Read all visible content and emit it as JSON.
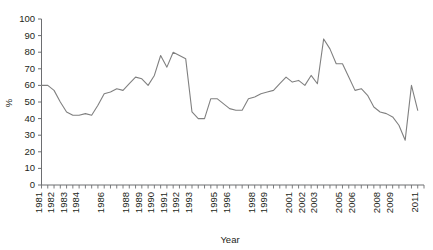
{
  "chart_data": {
    "type": "line",
    "title": "",
    "xlabel": "Year",
    "ylabel": "%",
    "xlim": [
      1981,
      2011.5
    ],
    "ylim": [
      0,
      100
    ],
    "grid": false,
    "legend": null,
    "line_color": "#808080",
    "axis_color": "#6d6e71",
    "background": "#ffffff",
    "ytick_values": [
      0,
      10,
      20,
      30,
      40,
      50,
      60,
      70,
      80,
      90,
      100
    ],
    "ytick_labels": [
      "0",
      "10",
      "20",
      "30",
      "40",
      "50",
      "60",
      "70",
      "80",
      "90",
      "100"
    ],
    "xtick_labels": [
      "1981",
      "1982",
      "1983",
      "1984",
      "1986",
      "1988",
      "1989",
      "1990",
      "1991",
      "1992",
      "1993",
      "1995",
      "1996",
      "1998",
      "1999",
      "2001",
      "2002",
      "2003",
      "2005",
      "2006",
      "2008",
      "2009",
      "2011"
    ],
    "xtick_label_positions": [
      1981,
      1982,
      1983,
      1984,
      1986,
      1988,
      1989,
      1990,
      1991,
      1992,
      1993,
      1995,
      1996,
      1998,
      1999,
      2001,
      2002,
      2003,
      2005,
      2006,
      2008,
      2009,
      2011
    ],
    "x_tick_interval": 0.5,
    "series": [
      {
        "name": "percent",
        "x": [
          1981.0,
          1981.5,
          1982.0,
          1982.5,
          1983.0,
          1983.5,
          1984.0,
          1984.5,
          1985.0,
          1985.5,
          1986.0,
          1986.5,
          1987.0,
          1987.5,
          1988.0,
          1988.5,
          1989.0,
          1989.5,
          1990.0,
          1990.5,
          1991.0,
          1991.5,
          1992.0,
          1992.5,
          1993.0,
          1993.5,
          1994.0,
          1994.5,
          1995.0,
          1995.5,
          1996.0,
          1996.5,
          1997.0,
          1997.5,
          1998.0,
          1998.5,
          1999.0,
          1999.5,
          2000.0,
          2000.5,
          2001.0,
          2001.5,
          2002.0,
          2002.5,
          2003.0,
          2003.5,
          2004.0,
          2004.5,
          2005.0,
          2005.5,
          2006.0,
          2006.5,
          2007.0,
          2007.5,
          2008.0,
          2008.5,
          2009.0,
          2009.5,
          2010.0,
          2010.5,
          2011.0
        ],
        "values": [
          60,
          60,
          57,
          50,
          44,
          42,
          42,
          43,
          42,
          48,
          55,
          56,
          58,
          57,
          61,
          65,
          64,
          60,
          66,
          78,
          71,
          80,
          78,
          76,
          44,
          40,
          40,
          52,
          52,
          49,
          46,
          45,
          45,
          52,
          53,
          55,
          56,
          57,
          61,
          65,
          62,
          63,
          60,
          66,
          61,
          88,
          82,
          73,
          73,
          65,
          57,
          58,
          54,
          47,
          44,
          43,
          41,
          36,
          27,
          60,
          45
        ]
      }
    ]
  }
}
